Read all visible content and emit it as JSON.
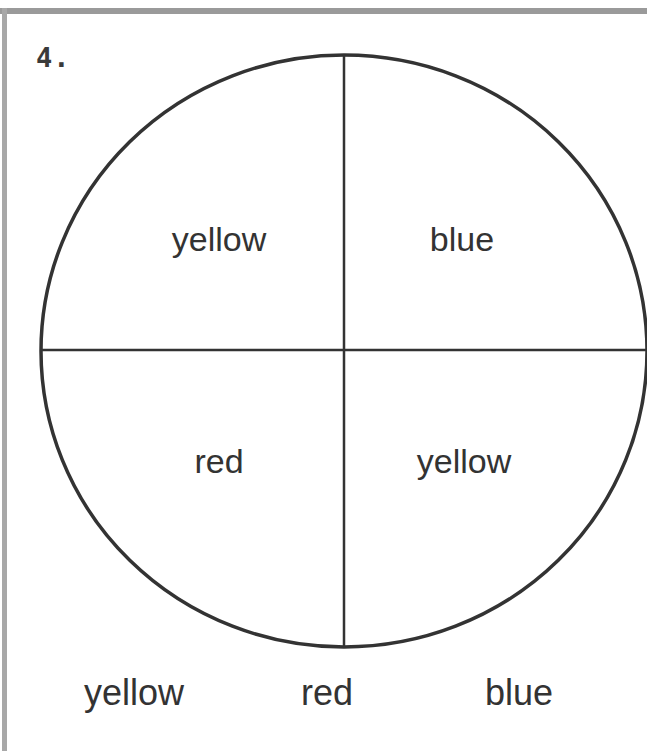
{
  "problem": {
    "number": "4.",
    "spinner": {
      "center": [
        344,
        351
      ],
      "radius_x": 303,
      "radius_y": 296,
      "outline_color": "#333333",
      "sections": [
        {
          "position": "top-left",
          "label": "yellow"
        },
        {
          "position": "top-right",
          "label": "blue"
        },
        {
          "position": "bottom-left",
          "label": "red"
        },
        {
          "position": "bottom-right",
          "label": "yellow"
        }
      ]
    },
    "choices": [
      "yellow",
      "red",
      "blue"
    ]
  }
}
